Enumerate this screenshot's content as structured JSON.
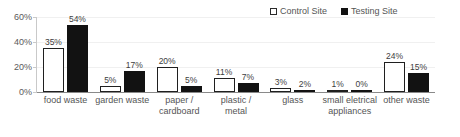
{
  "chart_data": {
    "type": "bar",
    "title": "",
    "subtitle": "",
    "xlabel": "",
    "ylabel": "",
    "ylim": [
      0,
      60
    ],
    "yticks": [
      "0%",
      "20%",
      "40%",
      "60%"
    ],
    "ytick_values": [
      0,
      20,
      40,
      60
    ],
    "grid": true,
    "legend_position": "top-right",
    "categories": [
      "food waste",
      "garden waste",
      "paper / cardboard",
      "plastic / metal",
      "glass",
      "small eletrical appliances",
      "other waste"
    ],
    "series": [
      {
        "name": "Control Site",
        "color": "#ffffff",
        "edge_color": "#1f1f1f",
        "values": [
          35,
          5,
          20,
          11,
          3,
          1,
          24
        ],
        "labels": [
          "35%",
          "5%",
          "20%",
          "11%",
          "3%",
          "1%",
          "24%"
        ]
      },
      {
        "name": "Testing Site",
        "color": "#121212",
        "edge_color": "#121212",
        "values": [
          54,
          17,
          5,
          7,
          2,
          0,
          15
        ],
        "labels": [
          "54%",
          "17%",
          "5%",
          "7%",
          "2%",
          "0%",
          "15%"
        ]
      }
    ]
  },
  "legend": {
    "items": [
      {
        "label": "Control Site",
        "style": "control"
      },
      {
        "label": "Testing Site",
        "style": "testing"
      }
    ]
  }
}
